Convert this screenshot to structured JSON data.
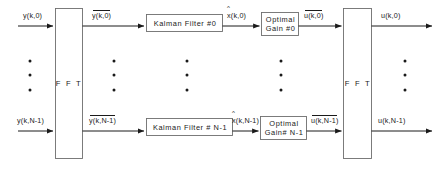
{
  "diagram": {
    "blocks": {
      "fft_input": {
        "label": "F F T",
        "name": "fft-input-block"
      },
      "fft_output": {
        "label": "F F T",
        "name": "fft-output-block"
      },
      "kalman_0": {
        "label": "Kalman Filter #0"
      },
      "kalman_n": {
        "label": "Kalman Filter # N-1"
      },
      "gain_0": {
        "line1": "Optimal",
        "line2": "Gain #0"
      },
      "gain_n": {
        "line1": "Optimal",
        "line2": "Gain# N-1"
      }
    },
    "signals": {
      "in_0": "y(k,0)",
      "in_n": "y(k,N-1)",
      "fft_out_0": "y(k,0)",
      "fft_out_n": "y(k,N-1)",
      "est_0": "x(k,0)",
      "est_n": "x(k,N-1)",
      "gain_out_0": "u(k,0)",
      "gain_out_n": "u(k,N-1)",
      "out_0": "u(k,0)",
      "out_n": "u(k,N-1)",
      "hat_symbol": "^"
    },
    "ellipsis": {
      "label": "vertical-ellipsis",
      "dot_count": 3
    },
    "colors": {
      "stroke": "#1a1a1a",
      "box_fill": "#ffffff",
      "background": "#ffffff"
    }
  }
}
